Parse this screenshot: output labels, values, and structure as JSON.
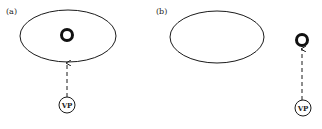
{
  "panels": [
    {
      "label": "(a)",
      "ellipse": {
        "cx": 68,
        "cy": 36,
        "rx": 48,
        "ry": 26
      },
      "ring": {
        "cx": 67,
        "cy": 35,
        "r": 6
      },
      "arrow": {
        "x": 67,
        "y_start": 97,
        "y_end": 63
      },
      "viewpoint": {
        "label": "VP",
        "cx": 67,
        "cy": 105,
        "r": 8
      },
      "description": "Object ring inside ellipse, viewpoint below ellipse looking up"
    },
    {
      "label": "(b)",
      "ellipse": {
        "cx": 217,
        "cy": 37,
        "rx": 47,
        "ry": 26
      },
      "ring": {
        "cx": 302,
        "cy": 40,
        "r": 6
      },
      "arrow": {
        "x": 302,
        "y_start": 100,
        "y_end": 49
      },
      "viewpoint": {
        "label": "VP",
        "cx": 303,
        "cy": 108,
        "r": 8
      },
      "description": "Empty ellipse, object ring outside to the right, viewpoint below ring looking up"
    }
  ],
  "colors": {
    "stroke": "#1a1a1a",
    "background": "#ffffff"
  }
}
